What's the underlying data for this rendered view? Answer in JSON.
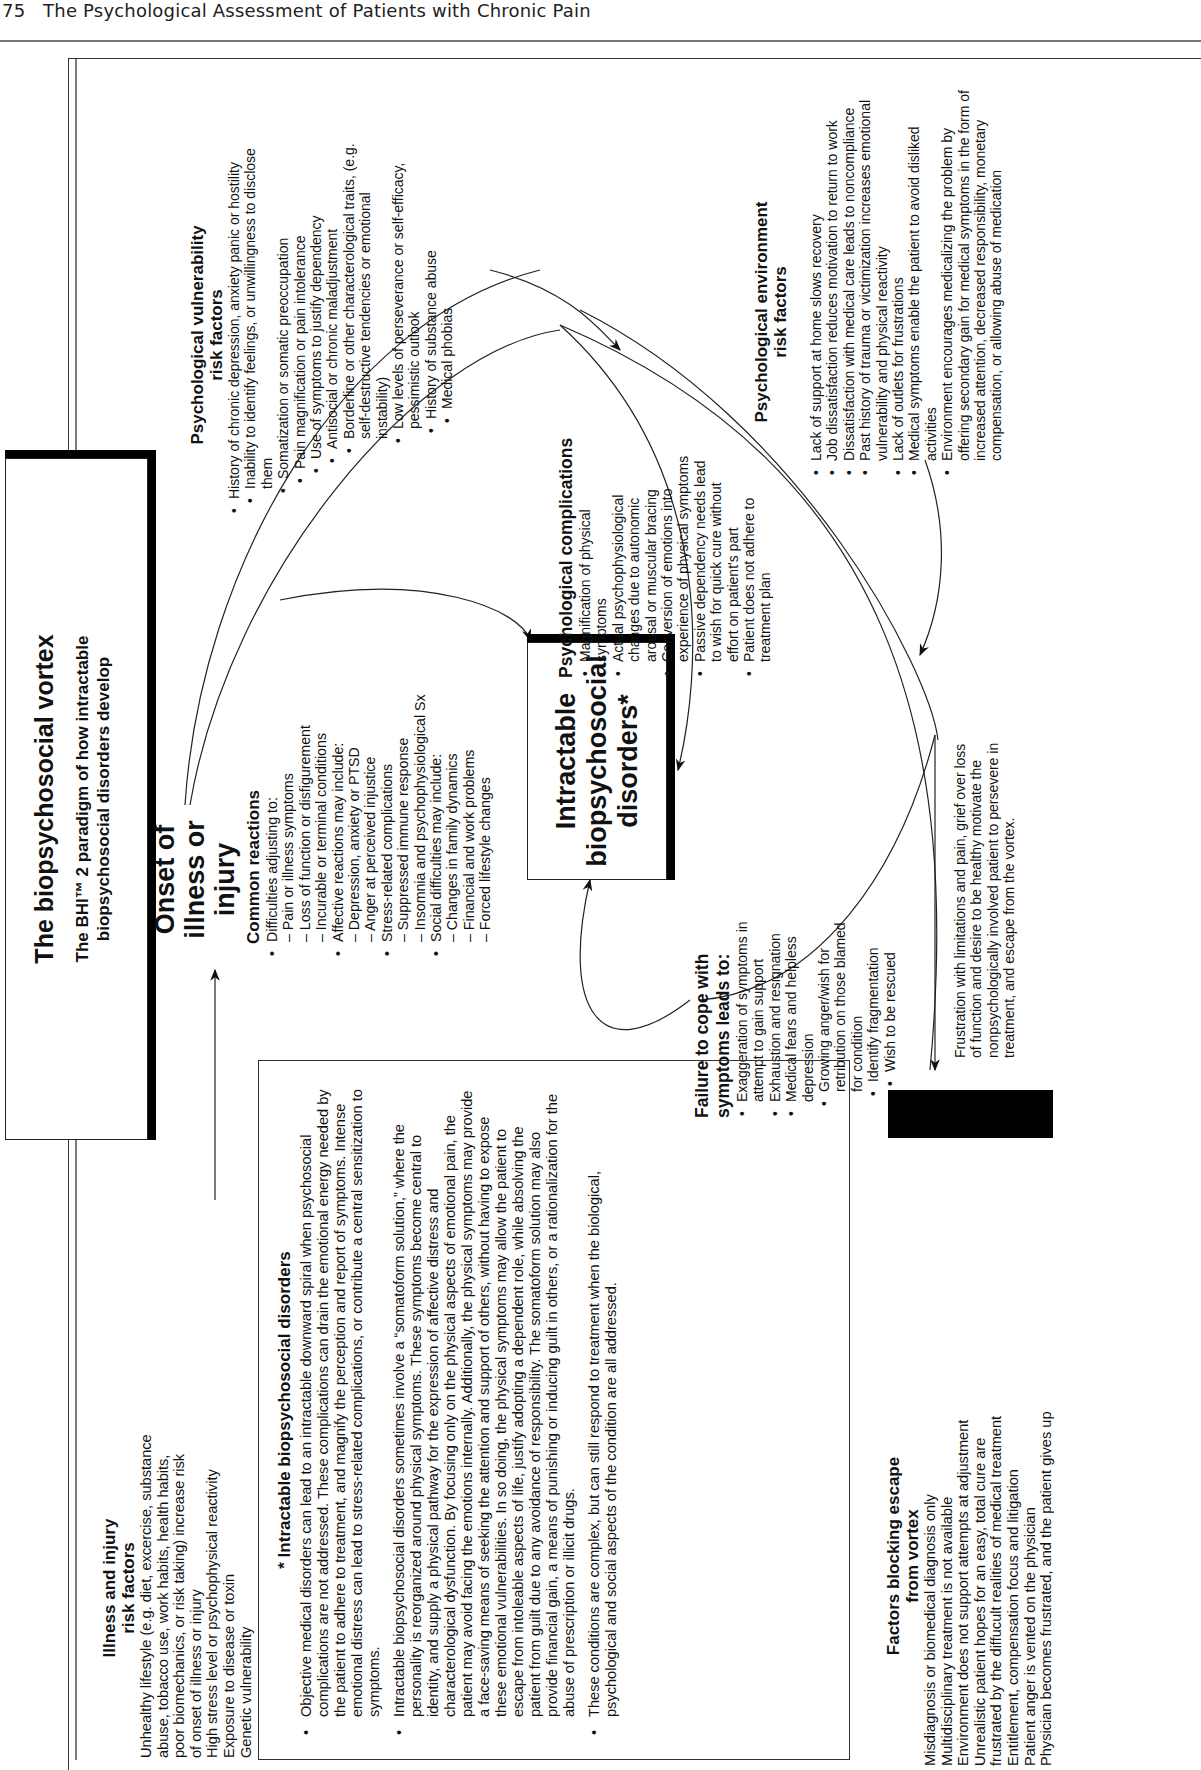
{
  "running_head": {
    "page_number": "75",
    "chapter_title": "The Psychological Assessment of Patients with Chronic Pain"
  },
  "figure": {
    "orientation": "rotated -90deg (landscape page printed sideways)",
    "title": {
      "main": "The biopsychosocial vortex",
      "sub_line1": "The BHI™ 2 paradigm of how intractable",
      "sub_line2": "biopsychosocial disorders develop"
    },
    "illness_risk": {
      "heading_line1": "Illness and injury",
      "heading_line2": "risk factors",
      "lines": [
        "Unhealthy lifestyle (e.g. diet, excercise, substance",
        "abuse, tobacco use, work habits, health habits,",
        "poor biomechanics, or risk taking) increase risk",
        "of onset of illness or injury",
        "High stress level or psychophysical reactivity",
        "Exposure to disease or toxin",
        "Genetic vulnerability"
      ]
    },
    "onset": {
      "line1": "Onset of",
      "line2": "illness or",
      "line3": "injury"
    },
    "common_reactions": {
      "heading": "Common reactions",
      "groups": [
        {
          "label": "Difficulties adjusting to:",
          "items": [
            "Pain or illness symptoms",
            "Loss of function or disfigurement",
            "Incurable or terminal conditions"
          ]
        },
        {
          "label": "Affective reactions may include:",
          "items": [
            "Depression, anxiety or PTSD",
            "Anger at perceived injustice"
          ]
        },
        {
          "label": "Stress-related complications",
          "items": [
            "Suppressed immune response",
            "Insomnia and psychophysiological Sx"
          ]
        },
        {
          "label": "Social difficulties may include:",
          "items": [
            "Changes in family dynamics",
            "Financial and work problems",
            "Forced lifestyle changes"
          ]
        }
      ]
    },
    "center_box": {
      "line1": "Intractable",
      "line2": "biopsychosocial",
      "line3": "disorders*"
    },
    "psych_complications": {
      "heading": "Psychological complications",
      "items": [
        "Magnification of physical symptoms",
        "Actual psychophysiological changes due to autonomic arousal or muscular bracing",
        "Conversion of emotions into experience of physical symptoms",
        "Passive dependency needs lead to wish for quick cure without effort on patient's part",
        "Patient does not adhere to treatment plan"
      ]
    },
    "psych_vulnerability": {
      "heading_line1": "Psychological vulnerability",
      "heading_line2": "risk factors",
      "items": [
        "History of chronic depression, anxiety panic or hostility",
        "Inability to identify feelings, or unwillingness to disclose them",
        "Somatization or somatic preoccupation",
        "Pain magnification or pain intolerance",
        "Use of symptoms to justify dependency",
        "Antisocial or chronic maladjustment",
        "Borderline or other characterological traits, (e.g. self-destructive tendencies or emotional instability)",
        "Low levels of perseverance or self-efficacy, pessimistic outlook",
        "History of substance abuse",
        "Medical phobias"
      ]
    },
    "psych_environment": {
      "heading_line1": "Psychological environment",
      "heading_line2": "risk factors",
      "items": [
        "Lack of support at home slows recovery",
        "Job dissatisfaction reduces motivation to return to work",
        "Dissatisfaction with medical care leads to noncompliance",
        "Past history of trauma or victimization increases emotional vulnerability and physical reactivity",
        "Lack of outlets for frustrations",
        "Medical symptoms enable the patient to avoid disliked activities",
        "Environment encourages medicalizing the problem by offering secondary gain for medical symptoms in the form of increased attention, decreased responsibility, monetary compensation, or allowing abuse of medication"
      ]
    },
    "failure_to_cope": {
      "heading_line1": "Failure to cope with",
      "heading_line2": "symptoms leads to:",
      "items": [
        "Exaggeration of symptoms in attempt to gain support",
        "Exhaustion and resignation",
        "Medical fears and helpless depression",
        "Growing anger/wish for retribution on those blamed for condition",
        "Identify fragmentation",
        "Wish to be rescued"
      ]
    },
    "escape_note": "Frustration with limitations and pain, grief over loss of function and desire to be healthy motivate the nonpsychologically involved patient to persevere in treatment, and escape from the vortex.",
    "footnote": {
      "heading": "* Intractable biopsychosocial disorders",
      "paragraphs": [
        "Objective medical disorders can lead to an intractable downward spiral when psychosocial complications are not addressed. These complications can drain the emotional energy needed by the patient to adhere to treatment, and magnify the perception and report of symptoms. Intense emotional distress can lead to stress-related complications, or contribute a central sensitization to symptoms.",
        "Intractable biopsychosocial disorders sometimes involve a “somatoform solution,” where the personality is reorganized around physical symptoms. These symptoms become central to identity, and supply a physical pathway for the expression of affective distress and characterological dysfunction. By focusing only on the physical aspects of emotional pain, the patient may avoid facing the emotions internally. Additionally, the physical symptoms may provide a face-saving means of seeking the attention and support of others, without having to expose these emotional vulnerabilities. In so doing, the physical symptoms may allow the patient to escape from intoleable aspects of life, justify adopting a dependent role, while absolving the patient from guilt due to any avoidance of responsibility. The somatoform solution may also provide financial gain, a means of punishing or inducing guilt in others, or a rationalization for the abuse of prescription or illicit drugs.",
        "These  conditions are complex, but can still respond to treatment when the biological, psychological and social aspects of the condition are all addressed."
      ]
    },
    "blocking_factors": {
      "heading_line1": "Factors blocking escape",
      "heading_line2": "from vortex",
      "lines": [
        "Misdiagnosis or biomedical diagnosis only",
        "Multidisciplinary treatment is not available",
        "Environment does not support attempts at adjustment",
        "Unrealistic patient hopes for an easy, total cure are",
        "frustrated by the diffucult realities of medical treatment",
        "Entitlement, compensation focus and litigation",
        "Patient anger is vented on the physician",
        "Physician becomes frustrated, and the patient gives up"
      ]
    },
    "colors": {
      "ink": "#111111",
      "rule": "#777777",
      "background": "#ffffff",
      "redaction_bar": "#000000"
    }
  }
}
